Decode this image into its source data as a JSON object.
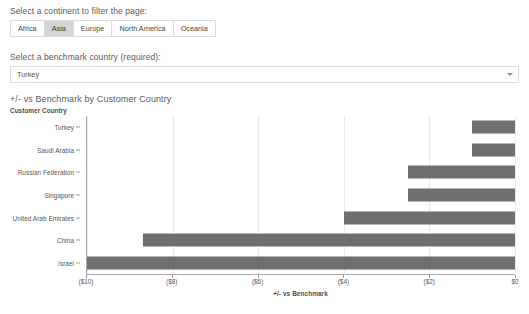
{
  "continent_filter": {
    "label": "Select a continent to filter the page:",
    "options": [
      {
        "label": "Africa",
        "selected": false
      },
      {
        "label": "Asia",
        "selected": true
      },
      {
        "label": "Europe",
        "selected": false
      },
      {
        "label": "North America",
        "selected": false
      },
      {
        "label": "Oceania",
        "selected": false
      }
    ]
  },
  "benchmark_select": {
    "label": "Select a benchmark country (required):",
    "value": "Turkey",
    "caret_icon": "chevron-down-icon"
  },
  "chart_data": {
    "type": "bar",
    "orientation": "horizontal",
    "title": "+/- vs Benchmark by Customer Country",
    "xlabel": "+/- vs Benchmark",
    "ylabel": "Customer Country",
    "categories": [
      "Turkey",
      "Saudi Arabia",
      "Russian Federation",
      "Singapore",
      "United Arab Emirates",
      "China",
      "Israel"
    ],
    "values": [
      -1.0,
      -1.0,
      -2.5,
      -2.5,
      -4.0,
      -8.7,
      -10.0
    ],
    "xlim": [
      -10,
      0
    ],
    "xticks": [
      -10,
      -8,
      -6,
      -4,
      -2,
      0
    ],
    "xtick_labels": [
      "($10)",
      "($8)",
      "($6)",
      "($4)",
      "($2)",
      "$0"
    ],
    "grid": true,
    "legend": false,
    "bar_color": "#6f6f6f"
  }
}
